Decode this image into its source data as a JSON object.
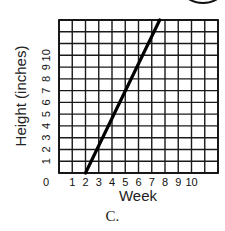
{
  "chart_data": {
    "type": "line",
    "title": "",
    "xlabel": "Week",
    "ylabel": "Height (inches)",
    "x_ticks": [
      "0",
      "1",
      "2",
      "3",
      "4",
      "5",
      "6",
      "7",
      "8",
      "9",
      "10"
    ],
    "y_ticks": [
      "1",
      "2",
      "3",
      "4",
      "5",
      "6",
      "7",
      "8",
      "9",
      "10"
    ],
    "xlim": [
      0,
      12
    ],
    "ylim": [
      0,
      13
    ],
    "grid": true,
    "legend": null,
    "series": [
      {
        "name": "plant height",
        "x": [
          2,
          7.6
        ],
        "y": [
          0,
          13
        ]
      }
    ],
    "caption": "C."
  },
  "labels": {
    "xlabel": "Week",
    "ylabel": "Height (inches)",
    "origin": "0",
    "caption": "C."
  }
}
